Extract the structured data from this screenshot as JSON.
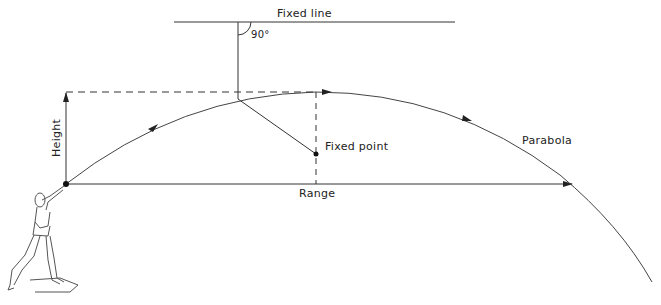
{
  "diagram": {
    "labels": {
      "fixed_line": "Fixed line",
      "angle": "90°",
      "fixed_point": "Fixed point",
      "parabola": "Parabola",
      "range": "Range",
      "height": "Height"
    },
    "colors": {
      "line": "#333333",
      "background": "#ffffff"
    }
  }
}
